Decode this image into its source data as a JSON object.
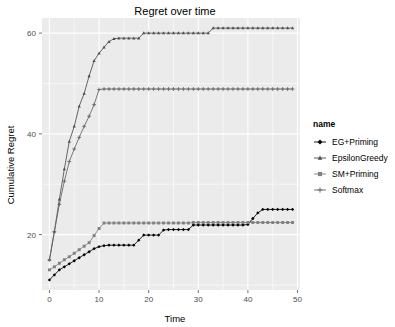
{
  "chart_data": {
    "type": "line",
    "title": "Regret over time",
    "xlabel": "Time",
    "ylabel": "Cumulative Regret",
    "xlim": [
      -1.5,
      50.5
    ],
    "ylim": [
      9.0,
      63.0
    ],
    "xticks": [
      0,
      10,
      20,
      30,
      40,
      50
    ],
    "yticks": [
      20,
      40,
      60
    ],
    "x_minor_ticks": [
      5,
      15,
      25,
      35,
      45
    ],
    "y_minor_ticks": [
      10,
      30,
      50
    ],
    "grid": true,
    "legend_position": "right",
    "legend_title": "name",
    "x": [
      0,
      1,
      2,
      3,
      4,
      5,
      6,
      7,
      8,
      9,
      10,
      11,
      12,
      13,
      14,
      15,
      16,
      17,
      18,
      19,
      20,
      21,
      22,
      23,
      24,
      25,
      26,
      27,
      28,
      29,
      30,
      31,
      32,
      33,
      34,
      35,
      36,
      37,
      38,
      39,
      40,
      41,
      42,
      43,
      44,
      45,
      46,
      47,
      48,
      49
    ],
    "series": [
      {
        "name": "EG+Priming",
        "marker": "filled-diamond",
        "color": "#000000",
        "values": [
          11.0,
          12.0,
          13.0,
          13.6,
          14.2,
          14.8,
          15.4,
          16.0,
          16.6,
          17.2,
          17.6,
          17.8,
          17.9,
          17.9,
          17.9,
          17.9,
          17.9,
          17.9,
          18.9,
          19.9,
          19.9,
          19.9,
          19.9,
          20.9,
          21.0,
          21.0,
          21.0,
          21.0,
          21.0,
          21.9,
          21.9,
          21.9,
          21.9,
          21.9,
          21.9,
          21.9,
          21.9,
          21.9,
          21.9,
          21.9,
          22.0,
          23.2,
          24.3,
          25.0,
          25.0,
          25.0,
          25.0,
          25.0,
          25.0,
          25.0
        ]
      },
      {
        "name": "EpsilonGreedy",
        "marker": "triangle",
        "color": "#4d4d4d",
        "values": [
          15.0,
          20.6,
          27.0,
          33.0,
          38.5,
          41.5,
          45.5,
          48.0,
          51.5,
          54.5,
          56.0,
          57.2,
          58.3,
          58.9,
          59.0,
          59.0,
          59.0,
          59.0,
          59.0,
          60.0,
          60.0,
          60.0,
          60.0,
          60.0,
          60.0,
          60.0,
          60.0,
          60.0,
          60.0,
          60.0,
          60.0,
          60.0,
          60.0,
          61.0,
          61.0,
          61.0,
          61.0,
          61.0,
          61.0,
          61.0,
          61.0,
          61.0,
          61.0,
          61.0,
          61.0,
          61.0,
          61.0,
          61.0,
          61.0,
          61.0
        ]
      },
      {
        "name": "SM+Priming",
        "marker": "filled-square",
        "color": "#7f7f7f",
        "values": [
          13.0,
          13.6,
          14.3,
          15.0,
          15.6,
          16.3,
          17.0,
          17.7,
          18.4,
          19.8,
          21.2,
          22.3,
          22.3,
          22.3,
          22.3,
          22.3,
          22.3,
          22.3,
          22.3,
          22.3,
          22.3,
          22.3,
          22.3,
          22.3,
          22.3,
          22.3,
          22.3,
          22.3,
          22.3,
          22.4,
          22.4,
          22.4,
          22.4,
          22.4,
          22.4,
          22.4,
          22.4,
          22.4,
          22.4,
          22.4,
          22.4,
          22.4,
          22.4,
          22.4,
          22.4,
          22.4,
          22.4,
          22.4,
          22.4,
          22.4
        ]
      },
      {
        "name": "Softmax",
        "marker": "plus",
        "color": "#666666",
        "values": [
          15.0,
          20.6,
          26.0,
          30.6,
          34.5,
          37.0,
          39.3,
          41.5,
          43.5,
          45.8,
          48.8,
          48.9,
          48.9,
          48.9,
          48.9,
          48.9,
          48.9,
          48.9,
          48.9,
          48.9,
          48.9,
          48.9,
          48.9,
          48.9,
          48.9,
          48.9,
          48.9,
          48.9,
          48.9,
          48.9,
          48.9,
          48.9,
          48.9,
          48.9,
          48.9,
          48.9,
          48.9,
          48.9,
          48.9,
          48.9,
          48.9,
          48.9,
          48.9,
          48.9,
          48.9,
          48.9,
          48.9,
          48.9,
          48.9,
          48.9
        ]
      }
    ]
  },
  "legend": {
    "title": "name",
    "items": [
      {
        "label": "EG+Priming",
        "marker": "filled-diamond",
        "color": "#000000"
      },
      {
        "label": "EpsilonGreedy",
        "marker": "triangle",
        "color": "#4d4d4d"
      },
      {
        "label": "SM+Priming",
        "marker": "filled-square",
        "color": "#7f7f7f"
      },
      {
        "label": "Softmax",
        "marker": "plus",
        "color": "#666666"
      }
    ]
  },
  "theme": {
    "panel_background": "#ebebeb",
    "grid_color": "#ffffff",
    "tick_label_color": "#4d4d4d",
    "plot_background": "#ffffff"
  }
}
